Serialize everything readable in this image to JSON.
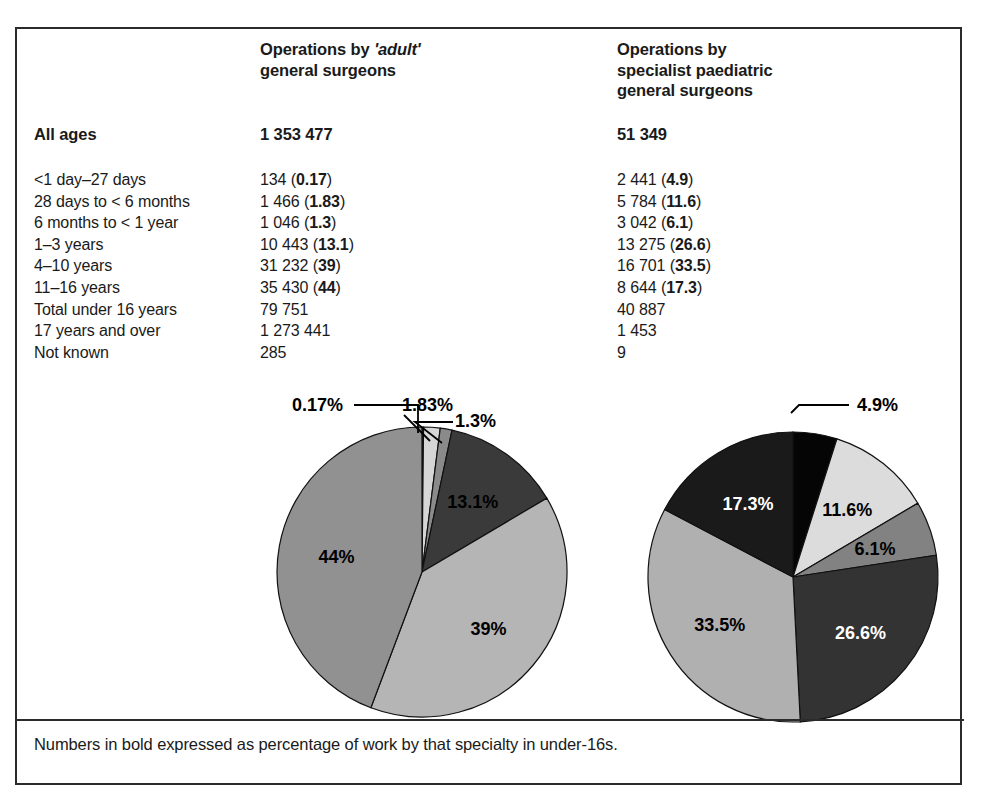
{
  "columns": {
    "label_header": "",
    "adult_header_line1": "Operations by ",
    "adult_header_emph": "'adult'",
    "adult_header_line2": "general surgeons",
    "paed_header_line1": "Operations by",
    "paed_header_line2": "specialist paediatric",
    "paed_header_line3": "general surgeons"
  },
  "all_ages": {
    "label": "All ages",
    "adult": "1 353 477",
    "paed": "51 349"
  },
  "rows": [
    {
      "label": "<1 day–27 days",
      "adult_count": "134",
      "adult_pct": "0.17",
      "paed_count": "2 441",
      "paed_pct": "4.9"
    },
    {
      "label": "28 days to < 6 months",
      "adult_count": "1 466",
      "adult_pct": "1.83",
      "paed_count": "5 784",
      "paed_pct": "11.6"
    },
    {
      "label": "6 months to < 1 year",
      "adult_count": "1 046",
      "adult_pct": "1.3",
      "paed_count": "3 042",
      "paed_pct": "6.1"
    },
    {
      "label": "1–3 years",
      "adult_count": "10 443",
      "adult_pct": "13.1",
      "paed_count": "13 275",
      "paed_pct": "26.6"
    },
    {
      "label": "4–10 years",
      "adult_count": "31 232",
      "adult_pct": "39",
      "paed_count": "16 701",
      "paed_pct": "33.5"
    },
    {
      "label": "11–16 years",
      "adult_count": "35 430",
      "adult_pct": "44",
      "paed_count": "8 644",
      "paed_pct": "17.3"
    },
    {
      "label": "Total under 16 years",
      "adult_count": "79 751",
      "adult_pct": "",
      "paed_count": "40 887",
      "paed_pct": ""
    },
    {
      "label": "17 years and over",
      "adult_count": "1 273 441",
      "adult_pct": "",
      "paed_count": "1 453",
      "paed_pct": ""
    },
    {
      "label": "Not known",
      "adult_count": "285",
      "adult_pct": "",
      "paed_count": "9",
      "paed_pct": ""
    }
  ],
  "footnote": "Numbers in bold expressed as percentage of work by that specialty in under-16s.",
  "chart_data": [
    {
      "type": "pie",
      "title": "Operations by 'adult' general surgeons – under 16s",
      "categories": [
        "<1 day–27 days",
        "28 days to < 6 months",
        "6 months to < 1 year",
        "1–3 years",
        "4–10 years",
        "11–16 years"
      ],
      "values": [
        0.17,
        1.83,
        1.3,
        13.1,
        39,
        44
      ],
      "labels": [
        "0.17%",
        "1.83%",
        "1.3%",
        "13.1%",
        "39%",
        "44%"
      ],
      "colors": [
        "#1c1c1c",
        "#d6d6d6",
        "#8a8a8a",
        "#3a3a3a",
        "#b5b5b5",
        "#919191"
      ],
      "label_colors": [
        "#000000",
        "#000000",
        "#000000",
        "#000000",
        "#000000",
        "#000000"
      ],
      "label_placement": [
        "callout",
        "callout",
        "callout",
        "inside",
        "inside",
        "inside"
      ],
      "start_angle": 0,
      "direction": "clockwise",
      "legend": "none"
    },
    {
      "type": "pie",
      "title": "Operations by specialist paediatric general surgeons – under 16s",
      "categories": [
        "<1 day–27 days",
        "28 days to < 6 months",
        "6 months to < 1 year",
        "1–3 years",
        "4–10 years",
        "11–16 years"
      ],
      "values": [
        4.9,
        11.6,
        6.1,
        26.6,
        33.5,
        17.3
      ],
      "labels": [
        "4.9%",
        "11.6%",
        "6.1%",
        "26.6%",
        "33.5%",
        "17.3%"
      ],
      "colors": [
        "#050505",
        "#dcdcdc",
        "#828282",
        "#333333",
        "#b0b0b0",
        "#1a1a1a"
      ],
      "label_colors": [
        "#000000",
        "#000000",
        "#000000",
        "#ffffff",
        "#000000",
        "#ffffff"
      ],
      "label_placement": [
        "callout",
        "inside",
        "inside",
        "inside",
        "inside",
        "inside"
      ],
      "start_angle": 0,
      "direction": "clockwise",
      "legend": "none"
    }
  ],
  "pie_geometry": {
    "left": {
      "cx": 405,
      "cy": 543,
      "r": 145
    },
    "right": {
      "cx": 776,
      "cy": 548,
      "r": 145
    }
  },
  "callouts": {
    "left": [
      {
        "text": "0.17%",
        "x": 275,
        "y": 382
      },
      {
        "text": "1.83%",
        "x": 385,
        "y": 382
      },
      {
        "text": "1.3%",
        "x": 438,
        "y": 398
      }
    ],
    "right": [
      {
        "text": "4.9%",
        "x": 840,
        "y": 382
      }
    ]
  }
}
